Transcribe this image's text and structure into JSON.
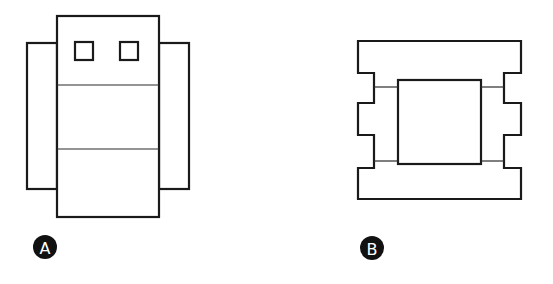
{
  "figures": [
    {
      "id": "A",
      "label": "A",
      "description": "center module with two side wings, two small squares at top, two horizontal divider lines"
    },
    {
      "id": "B",
      "label": "B",
      "description": "notched outer frame with inner square connected by four short lines"
    }
  ],
  "colors": {
    "stroke": "#1a1a1a",
    "badge": "#111111",
    "badge_text": "#ffffff",
    "background": "#ffffff"
  }
}
